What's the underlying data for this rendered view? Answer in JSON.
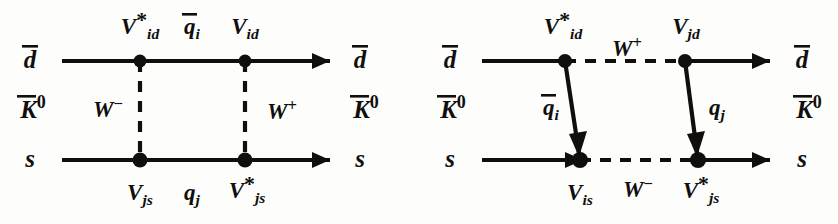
{
  "figure": {
    "background_color": "#fdfdfc",
    "line_color": "#100f0d",
    "panel_count": 2
  },
  "diagrams": [
    {
      "id": "left",
      "name": "uncrossed-box-diagram",
      "external": {
        "top_left": "d̄",
        "top_right": "d̄",
        "bottom_left": "s",
        "bottom_right": "s",
        "meson_left": "K̄⁰",
        "meson_right": "K̄⁰"
      },
      "vertices": [
        {
          "name": "top-left-vertex",
          "label": "V*id",
          "base": "V",
          "subscript": "id",
          "starred": true
        },
        {
          "name": "top-right-vertex",
          "label": "Vid",
          "base": "V",
          "subscript": "id",
          "starred": false
        },
        {
          "name": "bottom-left-vertex",
          "label": "Vjs",
          "base": "V",
          "subscript": "js",
          "starred": false
        },
        {
          "name": "bottom-right-vertex",
          "label": "V*js",
          "base": "V",
          "subscript": "js",
          "starred": true
        }
      ],
      "internal_lines": [
        {
          "name": "top-internal-quark",
          "label": "q̄i",
          "type": "fermion",
          "orientation": "horizontal-top"
        },
        {
          "name": "bottom-internal-quark",
          "label": "qj",
          "type": "fermion",
          "orientation": "horizontal-bottom"
        },
        {
          "name": "left-w-boson",
          "label": "W⁻",
          "type": "boson",
          "orientation": "vertical-left"
        },
        {
          "name": "right-w-boson",
          "label": "W⁺",
          "type": "boson",
          "orientation": "vertical-right"
        }
      ]
    },
    {
      "id": "right",
      "name": "crossed-box-diagram",
      "external": {
        "top_left": "d̄",
        "top_right": "d̄",
        "bottom_left": "s",
        "bottom_right": "s",
        "meson_left": "K̄⁰",
        "meson_right": "K̄⁰"
      },
      "vertices": [
        {
          "name": "top-left-vertex",
          "label": "V*id",
          "base": "V",
          "subscript": "id",
          "starred": true
        },
        {
          "name": "top-right-vertex",
          "label": "Vjd",
          "base": "V",
          "subscript": "jd",
          "starred": false
        },
        {
          "name": "bottom-left-vertex",
          "label": "Vis",
          "base": "V",
          "subscript": "is",
          "starred": false
        },
        {
          "name": "bottom-right-vertex",
          "label": "V*js",
          "base": "V",
          "subscript": "js",
          "starred": true
        }
      ],
      "internal_lines": [
        {
          "name": "top-w-boson",
          "label": "W⁺",
          "type": "boson",
          "orientation": "horizontal-top"
        },
        {
          "name": "bottom-w-boson",
          "label": "W⁻",
          "type": "boson",
          "orientation": "horizontal-bottom"
        },
        {
          "name": "left-internal-quark",
          "label": "q̄i",
          "type": "fermion",
          "orientation": "slanted-left"
        },
        {
          "name": "right-internal-quark",
          "label": "qj",
          "type": "fermion",
          "orientation": "slanted-right"
        }
      ]
    }
  ]
}
